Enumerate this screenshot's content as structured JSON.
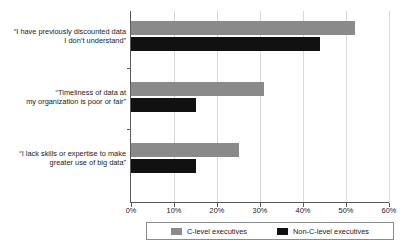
{
  "chart_data": {
    "type": "bar",
    "orientation": "horizontal",
    "title": "",
    "xlabel": "",
    "ylabel": "",
    "xlim": [
      0,
      60
    ],
    "xticks": [
      0,
      10,
      20,
      30,
      40,
      50,
      60
    ],
    "xtick_labels": [
      "0%",
      "10%",
      "20%",
      "30%",
      "40%",
      "50%",
      "60%"
    ],
    "grid": true,
    "legend_position": "bottom",
    "categories": [
      "“I have previously discounted data I don’t understand”",
      "“Timeliness of data at my organization is poor or fair”",
      "“I lack skills or expertise to make greater use of big data”"
    ],
    "category_lines": [
      [
        "“I have previously discounted data",
        "I don’t understand”"
      ],
      [
        "“Timeliness of data at",
        "my organization is poor or fair”"
      ],
      [
        "“I lack skills or expertise to make",
        "greater use of big data”"
      ]
    ],
    "series": [
      {
        "name": "C-level executives",
        "color": "#8a8a8a",
        "values": [
          52,
          31,
          25
        ]
      },
      {
        "name": "Non-C-level executives",
        "color": "#111111",
        "values": [
          44,
          15,
          15
        ]
      }
    ]
  },
  "legend": {
    "items": [
      {
        "label": "C-level executives",
        "color": "#8a8a8a"
      },
      {
        "label": "Non-C-level executives",
        "color": "#111111"
      }
    ]
  },
  "colors": {
    "series_c": "#8a8a8a",
    "series_nc": "#111111",
    "axis": "#5a5a5a",
    "grid": "#d9d9d9",
    "background": "#ffffff"
  }
}
